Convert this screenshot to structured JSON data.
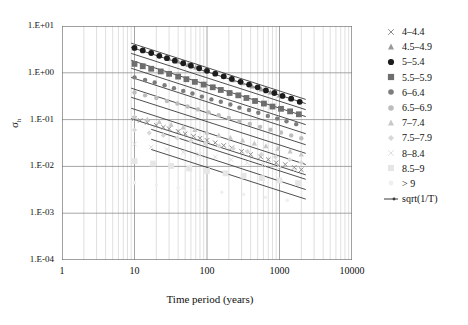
{
  "chart_data": {
    "type": "scatter",
    "title": "",
    "xlabel": "Time period (years)",
    "ylabel": "σₕ",
    "xscale": "log",
    "yscale": "log",
    "xlim": [
      1,
      10000
    ],
    "ylim": [
      0.0001,
      10
    ],
    "grid": true,
    "minor_grid": true,
    "legend_position": "right",
    "xticks": [
      "1",
      "10",
      "100",
      "1000",
      "10000"
    ],
    "xtick_values": [
      1,
      10,
      100,
      1000,
      10000
    ],
    "yticks": [
      "1.E+01",
      "1.E+00",
      "1.E-01",
      "1.E-02",
      "1.E-03",
      "1.E-04"
    ],
    "ytick_values": [
      10,
      1,
      0.1,
      0.01,
      0.001,
      0.0001
    ],
    "series": [
      {
        "name": "4–4.4",
        "marker": "cross",
        "color": "#8a8a8a",
        "x": [
          10,
          12,
          15,
          20,
          25,
          30,
          40,
          50,
          65,
          80,
          100,
          130,
          170,
          220,
          300,
          400,
          550,
          700,
          900,
          1200,
          1600,
          2000
        ],
        "y": [
          0.105,
          0.096,
          0.087,
          0.076,
          0.069,
          0.064,
          0.056,
          0.05,
          0.044,
          0.04,
          0.036,
          0.032,
          0.028,
          0.025,
          0.021,
          0.018,
          0.016,
          0.014,
          0.012,
          0.011,
          0.0095,
          0.0085
        ]
      },
      {
        "name": "4.5–4.9",
        "marker": "triangle",
        "color": "#9a9a9a",
        "x": [
          10,
          13,
          17,
          22,
          30,
          40,
          55,
          70,
          95,
          130,
          170,
          230,
          310,
          420,
          560,
          750,
          1000,
          1400,
          1900
        ],
        "y": [
          3.6,
          3.1,
          2.7,
          2.4,
          2.0,
          1.75,
          1.48,
          1.3,
          1.12,
          0.95,
          0.82,
          0.7,
          0.6,
          0.51,
          0.44,
          0.38,
          0.33,
          0.28,
          0.24
        ]
      },
      {
        "name": "5–5.4",
        "marker": "circle",
        "color": "#1c1c1c",
        "x": [
          10,
          13,
          17,
          22,
          28,
          36,
          47,
          60,
          78,
          100,
          130,
          170,
          220,
          290,
          380,
          500,
          650,
          850,
          1100,
          1450,
          1900
        ],
        "y": [
          3.4,
          3.0,
          2.65,
          2.3,
          2.05,
          1.82,
          1.6,
          1.42,
          1.25,
          1.1,
          0.96,
          0.84,
          0.74,
          0.64,
          0.56,
          0.49,
          0.42,
          0.37,
          0.32,
          0.28,
          0.24
        ]
      },
      {
        "name": "5.5–5.9",
        "marker": "square",
        "color": "#6e6e6e",
        "x": [
          10,
          13,
          17,
          23,
          30,
          40,
          52,
          68,
          90,
          120,
          155,
          205,
          270,
          350,
          460,
          610,
          800,
          1050,
          1400,
          1850
        ],
        "y": [
          1.55,
          1.38,
          1.22,
          1.07,
          0.95,
          0.83,
          0.73,
          0.64,
          0.56,
          0.49,
          0.43,
          0.37,
          0.33,
          0.29,
          0.25,
          0.22,
          0.19,
          0.17,
          0.15,
          0.13
        ]
      },
      {
        "name": "6–6.4",
        "marker": "circle-small",
        "color": "#7d7d7d",
        "x": [
          10,
          14,
          19,
          26,
          35,
          47,
          63,
          85,
          115,
          155,
          210,
          280,
          380,
          510,
          690,
          930,
          1250,
          1700
        ],
        "y": [
          0.8,
          0.7,
          0.62,
          0.54,
          0.47,
          0.41,
          0.36,
          0.31,
          0.27,
          0.24,
          0.21,
          0.18,
          0.16,
          0.14,
          0.12,
          0.105,
          0.092,
          0.08
        ]
      },
      {
        "name": "6.5–6.9",
        "marker": "circle-small",
        "color": "#bdbdbd",
        "x": [
          10,
          14,
          20,
          28,
          39,
          54,
          75,
          105,
          145,
          200,
          280,
          390,
          540,
          750,
          1050,
          1450,
          2000
        ],
        "y": [
          0.38,
          0.33,
          0.29,
          0.25,
          0.22,
          0.19,
          0.165,
          0.143,
          0.124,
          0.108,
          0.093,
          0.081,
          0.07,
          0.061,
          0.053,
          0.046,
          0.04
        ]
      },
      {
        "name": "7–7.4",
        "marker": "triangle",
        "color": "#c8c8c8",
        "x": [
          10,
          15,
          22,
          32,
          47,
          68,
          100,
          145,
          210,
          310,
          450,
          650,
          950,
          1400,
          2000
        ],
        "y": [
          0.115,
          0.101,
          0.089,
          0.078,
          0.068,
          0.06,
          0.053,
          0.046,
          0.041,
          0.036,
          0.031,
          0.027,
          0.024,
          0.021,
          0.018
        ]
      },
      {
        "name": "7.5–7.9",
        "marker": "diamond",
        "color": "#d8d8d8",
        "x": [
          10,
          16,
          25,
          39,
          60,
          95,
          148,
          230,
          360,
          560,
          880,
          1380,
          2000
        ],
        "y": [
          0.06,
          0.052,
          0.046,
          0.04,
          0.035,
          0.031,
          0.027,
          0.024,
          0.021,
          0.018,
          0.016,
          0.014,
          0.012
        ]
      },
      {
        "name": "8–8.4",
        "marker": "cross",
        "color": "#dedede",
        "x": [
          10,
          17,
          28,
          47,
          78,
          130,
          215,
          360,
          600,
          1000,
          1650
        ],
        "y": [
          0.03,
          0.026,
          0.023,
          0.02,
          0.018,
          0.016,
          0.014,
          0.012,
          0.011,
          0.0095,
          0.0085
        ]
      },
      {
        "name": "8.5–9",
        "marker": "square",
        "color": "#e6e6e6",
        "x": [
          10,
          18,
          32,
          57,
          100,
          180,
          320,
          570,
          1000,
          1800
        ],
        "y": [
          0.013,
          0.0115,
          0.0102,
          0.009,
          0.008,
          0.0071,
          0.0063,
          0.0056,
          0.005,
          0.0044
        ]
      },
      {
        "name": "> 9",
        "marker": "none",
        "color": "#efefef",
        "x": [
          10,
          20,
          40,
          80,
          160,
          320,
          640,
          1280
        ],
        "y": [
          0.0045,
          0.004,
          0.0035,
          0.0031,
          0.0028,
          0.0025,
          0.0022,
          0.0019
        ]
      },
      {
        "name": "sqrt(1/T)",
        "marker": "line",
        "color": "#3a3a3a",
        "note": "reference lines of slope -0.5 on log-log axes"
      }
    ],
    "reference_lines": [
      {
        "x0": 9,
        "y0": 4.3,
        "x1": 2300,
        "y1": 0.27
      },
      {
        "x0": 9,
        "y0": 3.5,
        "x1": 2300,
        "y1": 0.22
      },
      {
        "x0": 9,
        "y0": 2.6,
        "x1": 2300,
        "y1": 0.163
      },
      {
        "x0": 9,
        "y0": 1.85,
        "x1": 2300,
        "y1": 0.116
      },
      {
        "x0": 9,
        "y0": 1.25,
        "x1": 2300,
        "y1": 0.078
      },
      {
        "x0": 9,
        "y0": 0.8,
        "x1": 2300,
        "y1": 0.05
      },
      {
        "x0": 9,
        "y0": 0.47,
        "x1": 2300,
        "y1": 0.029
      },
      {
        "x0": 9,
        "y0": 0.3,
        "x1": 2300,
        "y1": 0.019
      },
      {
        "x0": 9,
        "y0": 0.175,
        "x1": 2300,
        "y1": 0.011
      },
      {
        "x0": 9,
        "y0": 0.105,
        "x1": 2300,
        "y1": 0.0066
      },
      {
        "x0": 17,
        "y0": 0.062,
        "x1": 2300,
        "y1": 0.0053
      },
      {
        "x0": 17,
        "y0": 0.038,
        "x1": 2300,
        "y1": 0.0032
      },
      {
        "x0": 17,
        "y0": 0.023,
        "x1": 2300,
        "y1": 0.002
      }
    ]
  },
  "axes": {
    "y_title": "σ",
    "y_title_sub": "h",
    "x_title": "Time period (years)",
    "y_labels": [
      "1.E+01",
      "1.E+00",
      "1.E-01",
      "1.E-02",
      "1.E-03",
      "1.E-04"
    ],
    "x_labels": [
      "1",
      "10",
      "100",
      "1000",
      "10000"
    ]
  },
  "legend": {
    "items": [
      {
        "label": "4–4.4",
        "marker": "cross",
        "color": "#8a8a8a"
      },
      {
        "label": "4.5–4.9",
        "marker": "triangle",
        "color": "#9a9a9a"
      },
      {
        "label": "5–5.4",
        "marker": "circle",
        "color": "#1c1c1c"
      },
      {
        "label": "5.5–5.9",
        "marker": "square",
        "color": "#6e6e6e"
      },
      {
        "label": "6–6.4",
        "marker": "circle-small",
        "color": "#7d7d7d"
      },
      {
        "label": "6.5–6.9",
        "marker": "circle-small",
        "color": "#bdbdbd"
      },
      {
        "label": "7–7.4",
        "marker": "triangle",
        "color": "#c8c8c8"
      },
      {
        "label": "7.5–7.9",
        "marker": "diamond",
        "color": "#d8d8d8"
      },
      {
        "label": "8–8.4",
        "marker": "cross",
        "color": "#dedede"
      },
      {
        "label": "8.5–9",
        "marker": "square",
        "color": "#e6e6e6"
      },
      {
        "label": "> 9",
        "marker": "none",
        "color": "#efefef"
      },
      {
        "label": "sqrt(1/T)",
        "marker": "line",
        "color": "#3a3a3a"
      }
    ]
  }
}
